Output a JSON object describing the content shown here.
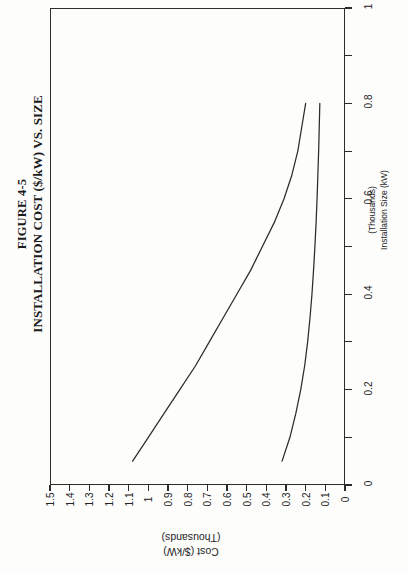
{
  "figure": {
    "number": "FIGURE 4-5",
    "title": "INSTALLATION COST ($/kW) VS. SIZE"
  },
  "axis_titles": {
    "cost_main": "Cost ($/kW)",
    "cost_sub": "(Thousands)",
    "size_main": "Installation Size (kW)",
    "size_sub": "(Thousands)"
  },
  "ticks": {
    "cost": [
      "1.5",
      "1.4",
      "1.3",
      "1.2",
      "1.1",
      "1",
      "0.9",
      "0.8",
      "0.7",
      "0.6",
      "0.5",
      "0.4",
      "0.3",
      "0.2",
      "0.1",
      "0"
    ],
    "size": [
      "0",
      "0.2",
      "0.4",
      "0.6",
      "0.8",
      "1"
    ]
  },
  "chart_data": {
    "type": "line",
    "title": "INSTALLATION COST ($/kW) VS. SIZE",
    "subtitle": "FIGURE 4-5",
    "orientation": "rotated-90-ccw",
    "xlabel": "Installation Size (kW) (Thousands)",
    "ylabel": "Cost ($/kW) (Thousands)",
    "xlim": [
      0,
      1
    ],
    "ylim": [
      0,
      1.5
    ],
    "xticks": [
      0,
      0.2,
      0.4,
      0.6,
      0.8,
      1
    ],
    "yticks": [
      0,
      0.1,
      0.2,
      0.3,
      0.4,
      0.5,
      0.6,
      0.7,
      0.8,
      0.9,
      1,
      1.1,
      1.2,
      1.3,
      1.4,
      1.5
    ],
    "grid": false,
    "legend": "none",
    "series": [
      {
        "name": "upper-cost-curve",
        "x": [
          0.05,
          0.1,
          0.15,
          0.2,
          0.25,
          0.3,
          0.35,
          0.4,
          0.45,
          0.5,
          0.55,
          0.6,
          0.65,
          0.7,
          0.75,
          0.8
        ],
        "y": [
          1.08,
          1.0,
          0.92,
          0.84,
          0.76,
          0.69,
          0.62,
          0.55,
          0.48,
          0.42,
          0.36,
          0.31,
          0.27,
          0.24,
          0.22,
          0.2
        ]
      },
      {
        "name": "lower-cost-curve",
        "x": [
          0.05,
          0.1,
          0.15,
          0.2,
          0.25,
          0.3,
          0.35,
          0.4,
          0.45,
          0.5,
          0.55,
          0.6,
          0.65,
          0.7,
          0.75,
          0.8
        ],
        "y": [
          0.32,
          0.28,
          0.25,
          0.225,
          0.205,
          0.19,
          0.178,
          0.168,
          0.16,
          0.153,
          0.147,
          0.142,
          0.138,
          0.134,
          0.131,
          0.128
        ]
      }
    ]
  },
  "colors": {
    "ink": "#2b2b2b",
    "page": "#fdfdfc"
  }
}
